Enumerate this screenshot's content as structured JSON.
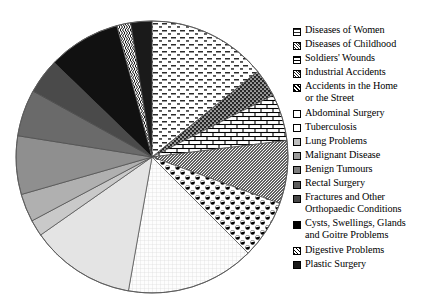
{
  "chart_data": {
    "type": "pie",
    "title": "",
    "subtitle": "",
    "xlabel": "",
    "ylabel": "",
    "grid": false,
    "legend_position": "right",
    "start_angle_deg": 0,
    "direction": "clockwise",
    "categories": [
      "Diseases of Women",
      "Diseases of Childhood",
      "Soldiers' Wounds",
      "Industrial Accidents",
      "Accidents in the Home\nor the Street",
      "Abdominal Surgery",
      "Tuberculosis",
      "Lung Problems",
      "Malignant Disease",
      "Benign Tumours",
      "Rectal Surgery",
      "Fractures and Other\nOrthopaedic Conditions",
      "Cysts, Swellings, Glands\nand Goitre Problems",
      "Digestive Problems",
      "Plastic Surgery"
    ],
    "values": [
      51,
      12,
      20,
      27,
      25,
      55,
      45,
      7,
      12,
      25,
      20,
      15,
      31,
      6,
      9
    ],
    "units": "degrees",
    "slices": [
      {
        "label": "Diseases of Women",
        "angle_deg": 51,
        "percent": 14.2,
        "pattern": "dashes",
        "fill": "#ffffff",
        "ink": "#2b2b2b"
      },
      {
        "label": "Diseases of Childhood",
        "angle_deg": 12,
        "percent": 3.3,
        "pattern": "dense-dots-dark",
        "fill": "#3a3a3a",
        "ink": "#000000"
      },
      {
        "label": "Soldiers' Wounds",
        "angle_deg": 20,
        "percent": 5.6,
        "pattern": "brick",
        "fill": "#ffffff",
        "ink": "#000000"
      },
      {
        "label": "Industrial Accidents",
        "angle_deg": 27,
        "percent": 7.5,
        "pattern": "fine-diagonal",
        "fill": "#6e6e6e",
        "ink": "#111111"
      },
      {
        "label": "Accidents in the Home or the Street",
        "angle_deg": 25,
        "percent": 6.9,
        "pattern": "polka-dots",
        "fill": "#ffffff",
        "ink": "#000000"
      },
      {
        "label": "Abdominal Surgery",
        "angle_deg": 55,
        "percent": 15.3,
        "pattern": "fine-grid",
        "fill": "#fbfbfb",
        "ink": "#d6d6d6"
      },
      {
        "label": "Tuberculosis",
        "angle_deg": 45,
        "percent": 12.5,
        "pattern": "solid",
        "fill": "#e4e4e4",
        "ink": "#e4e4e4"
      },
      {
        "label": "Lung Problems",
        "angle_deg": 7,
        "percent": 1.9,
        "pattern": "solid",
        "fill": "#c9c9c9",
        "ink": "#c9c9c9"
      },
      {
        "label": "Malignant Disease",
        "angle_deg": 12,
        "percent": 3.3,
        "pattern": "solid",
        "fill": "#b0b0b0",
        "ink": "#b0b0b0"
      },
      {
        "label": "Benign Tumours",
        "angle_deg": 25,
        "percent": 6.9,
        "pattern": "solid",
        "fill": "#8f8f8f",
        "ink": "#8f8f8f"
      },
      {
        "label": "Rectal Surgery",
        "angle_deg": 20,
        "percent": 5.6,
        "pattern": "solid",
        "fill": "#6a6a6a",
        "ink": "#6a6a6a"
      },
      {
        "label": "Fractures and Other Orthopaedic Conditions",
        "angle_deg": 15,
        "percent": 4.2,
        "pattern": "solid",
        "fill": "#4a4a4a",
        "ink": "#4a4a4a"
      },
      {
        "label": "Cysts, Swellings, Glands and Goitre Problems",
        "angle_deg": 31,
        "percent": 8.6,
        "pattern": "solid",
        "fill": "#111111",
        "ink": "#111111"
      },
      {
        "label": "Digestive Problems",
        "angle_deg": 6,
        "percent": 1.7,
        "pattern": "zigzag",
        "fill": "#ffffff",
        "ink": "#000000"
      },
      {
        "label": "Plastic Surgery",
        "angle_deg": 9,
        "percent": 2.5,
        "pattern": "solid",
        "fill": "#1a1a1a",
        "ink": "#1a1a1a"
      }
    ]
  },
  "legend": {
    "items": [
      {
        "label": "Diseases of Women",
        "swatch": "dashes"
      },
      {
        "label": "Diseases of Childhood",
        "swatch": "dense-dots-dark"
      },
      {
        "label": "Soldiers' Wounds",
        "swatch": "brick"
      },
      {
        "label": "Industrial Accidents",
        "swatch": "fine-diagonal"
      },
      {
        "label": "Accidents in the Home\nor the Street",
        "swatch": "polka-dots"
      },
      {
        "label": "Abdominal Surgery",
        "swatch": "fine-grid"
      },
      {
        "label": "Tuberculosis",
        "swatch": "light-gray"
      },
      {
        "label": "Lung Problems",
        "swatch": "gray-1"
      },
      {
        "label": "Malignant Disease",
        "swatch": "gray-2"
      },
      {
        "label": "Benign Tumours",
        "swatch": "gray-3"
      },
      {
        "label": "Rectal Surgery",
        "swatch": "gray-4"
      },
      {
        "label": "Fractures and Other\nOrthopaedic Conditions",
        "swatch": "gray-5"
      },
      {
        "label": "Cysts, Swellings, Glands\nand Goitre Problems",
        "swatch": "black"
      },
      {
        "label": "Digestive Problems",
        "swatch": "zigzag"
      },
      {
        "label": "Plastic Surgery",
        "swatch": "near-black"
      }
    ]
  },
  "colors": {
    "background": "#ffffff",
    "outline": "#555555",
    "text": "#000000"
  }
}
